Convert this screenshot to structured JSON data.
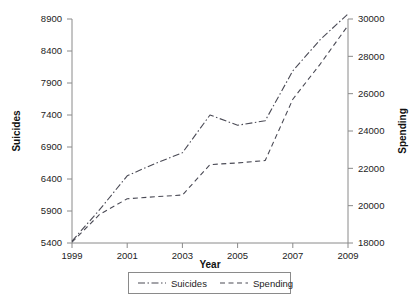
{
  "chart_data": {
    "type": "line",
    "title": "",
    "xlabel": "Year",
    "ylabel": "Suicides",
    "y2label": "Spending",
    "x": [
      1999,
      2000,
      2001,
      2002,
      2003,
      2004,
      2005,
      2006,
      2007,
      2008,
      2009
    ],
    "xlim": [
      1999,
      2009
    ],
    "ylim": [
      5400,
      8900
    ],
    "y2lim": [
      18000,
      30000
    ],
    "grid": false,
    "legend_position": "bottom-center",
    "xticks": [
      "1999",
      "2001",
      "2003",
      "2005",
      "2007",
      "2009"
    ],
    "xtick_values": [
      1999,
      2001,
      2003,
      2005,
      2007,
      2009
    ],
    "yticks": [
      "5400",
      "5900",
      "6400",
      "6900",
      "7400",
      "7900",
      "8400",
      "8900"
    ],
    "ytick_values": [
      5400,
      5900,
      6400,
      6900,
      7400,
      7900,
      8400,
      8900
    ],
    "y2ticks": [
      "18000",
      "20000",
      "22000",
      "24000",
      "26000",
      "28000",
      "30000"
    ],
    "y2tick_values": [
      18000,
      20000,
      22000,
      24000,
      26000,
      28000,
      30000
    ],
    "series": [
      {
        "name": "Suicides",
        "axis": "left",
        "dash": "dashdot",
        "values": [
          5430,
          5920,
          6450,
          6640,
          6810,
          7400,
          7240,
          7310,
          8090,
          8580,
          8980
        ]
      },
      {
        "name": "Spending",
        "axis": "right",
        "dash": "dashed",
        "values": [
          18050,
          19530,
          20370,
          20480,
          20570,
          22200,
          22290,
          22420,
          25700,
          27600,
          29650
        ]
      }
    ]
  },
  "legend": {
    "items": [
      {
        "label": "Suicides"
      },
      {
        "label": "Spending"
      }
    ]
  }
}
